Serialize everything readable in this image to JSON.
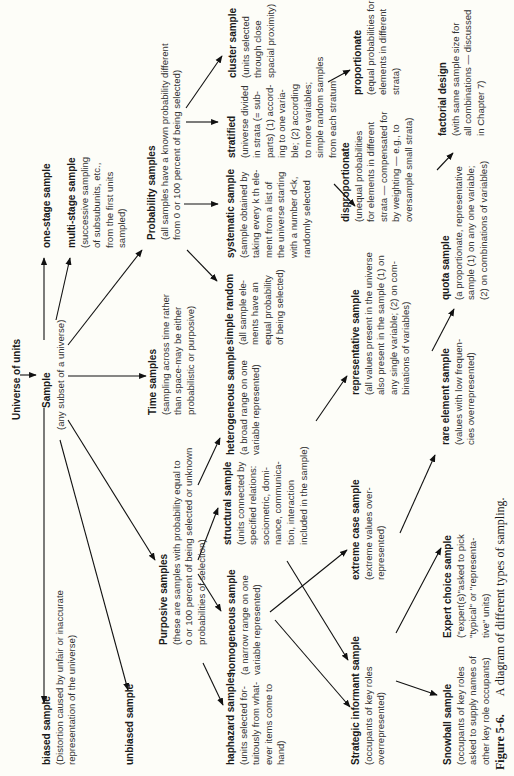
{
  "diagram": {
    "root": {
      "title": "Universe of units"
    },
    "sample": {
      "title": "Sample",
      "desc": "(any subset of a universe)"
    },
    "one_stage": {
      "title": "one-stage sample"
    },
    "multi_stage": {
      "title": "multi-stage sample",
      "desc": [
        "(successive sampling",
        "of subsubunits, etc.,",
        "from the first units",
        "sampled)"
      ]
    },
    "biased": {
      "title": "biased sample",
      "desc": [
        "(Distortion caused by unfair or inaccurate",
        "representation of the universe)"
      ]
    },
    "unbiased": {
      "title": "unbiased sample"
    },
    "time": {
      "title": "Time samples",
      "desc": [
        "(sampling across time rather",
        "than space-may be either",
        "probabilistic or purposive)"
      ]
    },
    "probability": {
      "title": "Probability samples",
      "desc": [
        "(all samples have a known probability different",
        "from 0 or 100 percent of being selected)"
      ]
    },
    "purposive": {
      "title": "Purposive samples",
      "desc": [
        "(these are samples with probability equal to",
        "0 or 100 percent of being selected or unknown",
        "probabilities of selection)"
      ]
    },
    "cluster": {
      "title": "cluster sample",
      "desc": [
        "(units selected",
        "through close",
        "spacial proximity)"
      ]
    },
    "stratified": {
      "title": "stratified",
      "desc": [
        "(universe divided",
        "in strata (= sub-",
        "parts) (1) accord-",
        "ing to one varia-",
        "ble; (2) according",
        "to more variables;",
        "simple random samples",
        "from each stratum"
      ]
    },
    "systematic": {
      "title": "systematic sample",
      "desc": [
        "(sample obtained by",
        "taking every k th ele-",
        "ment from a list of",
        "the universe starting",
        "with a number d<k,",
        "randomly selected"
      ]
    },
    "simple_random": {
      "title": "simple random",
      "desc": [
        "(all sample ele-",
        "ments have an",
        "equal probability",
        "of being selected)"
      ]
    },
    "heterogeneous": {
      "title": "heterogeneous sample",
      "desc": [
        "(a broad range on one",
        "variable represented)"
      ]
    },
    "structural": {
      "title": "structural sample",
      "desc": [
        "(units connected by",
        "specified relations:",
        "sociometric, domi-",
        "nance, communica-",
        "tion, interaction",
        "included in the sample)"
      ]
    },
    "homogeneous": {
      "title": "homogeneous sample",
      "desc": [
        "(a narrow range on one",
        "variable represented)"
      ]
    },
    "haphazard": {
      "title": "haphazard samples",
      "desc": [
        "(units selected for-",
        "tuitously from what-",
        "ever items come to",
        "hand)"
      ]
    },
    "proportionate": {
      "title": "proportionate",
      "desc": [
        "(equal probabilities for",
        "elements in different",
        "strata)"
      ]
    },
    "disproportionate": {
      "title": "disproportionate",
      "desc": [
        "(unequal probabilities",
        "for elements in different",
        "strata — compensated for",
        "by weighting — e.g., to",
        "oversample small strata)"
      ]
    },
    "factorial": {
      "title": "factorial design",
      "desc": [
        "(with same sample size for",
        "all combinations — discussed",
        "in Chapter 7)"
      ]
    },
    "representative": {
      "title": "representative sample",
      "desc": [
        "(all values present in the universe",
        "also present in the sample (1) on",
        "any single variable; (2) on com-",
        "binations of variables)"
      ]
    },
    "quota": {
      "title": "quota sample",
      "desc": [
        "(a proportionate, representative",
        "sample (1) on any one variable;",
        "(2) on combinations of variables)"
      ]
    },
    "extreme_case": {
      "title": "extreme case sample",
      "desc": [
        "(extreme values over-",
        "represented)"
      ]
    },
    "rare_element": {
      "title": "rare element sample",
      "desc": [
        "(values with low frequen-",
        "cies overrepresented)"
      ]
    },
    "strategic_informant": {
      "title": "Strategic informant sample",
      "desc": [
        "(occupants of key roles",
        "overrepresented)"
      ]
    },
    "expert_choice": {
      "title": "Expert choice sample",
      "desc": [
        "(\"expert(s)\"asked to pick",
        "\"typical\" or \"representa-",
        "tive\" units)"
      ]
    },
    "snowball": {
      "title": "Snowball sample",
      "desc": [
        "(occupants of key roles",
        "asked to supply names of",
        "other key role occupants)"
      ]
    }
  },
  "caption": {
    "label": "Figure 5-6.",
    "text": "A diagram of different types of sampling."
  }
}
